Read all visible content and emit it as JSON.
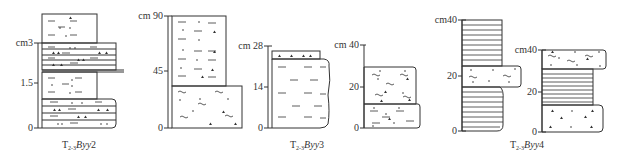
{
  "figure": {
    "type": "stratigraphic-columns",
    "line_color": "#333333",
    "background": "#ffffff"
  },
  "columns": [
    {
      "id": "by2",
      "caption": {
        "prefix": "T",
        "sub": "2-3",
        "name": "By",
        "num": "2"
      },
      "axis": {
        "unit": "cm",
        "ticks": [
          {
            "label": "cm3",
            "value": 3
          },
          {
            "label": "1.5",
            "value": 1.5
          },
          {
            "label": "0",
            "value": 0
          }
        ]
      },
      "layers_bottom_to_top": [
        "silty fine sandstone (thin laminated, wide)",
        "siltstone with dots/triangles",
        "thin interbedded laminae (wide)",
        "siltstone with dots/triangles"
      ]
    },
    {
      "id": "by3",
      "caption": {
        "prefix": "T",
        "sub": "2-3",
        "name": "By",
        "num": "3"
      },
      "sub_columns": [
        {
          "axis": {
            "ticks": [
              {
                "label": "cm 90",
                "value": 90
              },
              {
                "label": "45",
                "value": 45
              },
              {
                "label": "0",
                "value": 0
              }
            ]
          },
          "layers_bottom_to_top": [
            "wavy-laminated sandstone with dots",
            "siltstone with dashes and dots"
          ]
        },
        {
          "axis": {
            "ticks": [
              {
                "label": "cm 28",
                "value": 28
              },
              {
                "label": "14",
                "value": 14
              },
              {
                "label": "0",
                "value": 0
              }
            ]
          },
          "layers_bottom_to_top": [
            "mudstone with dashes (irregular boundary)",
            "thin sandstone with triangles"
          ]
        },
        {
          "axis": {
            "ticks": [
              {
                "label": "cm 40",
                "value": 40
              },
              {
                "label": "20",
                "value": 20
              },
              {
                "label": "0",
                "value": 0
              }
            ]
          },
          "layers_bottom_to_top": [
            "silty sandstone with dashes and dots",
            "wavy-laminated sandstone"
          ]
        }
      ]
    },
    {
      "id": "by4",
      "caption": {
        "prefix": "T",
        "sub": "2-3",
        "name": "By",
        "num": "4"
      },
      "sub_columns": [
        {
          "axis": {
            "ticks": [
              {
                "label": "cm40",
                "value": 40
              },
              {
                "label": "20",
                "value": 20
              },
              {
                "label": "0",
                "value": 0
              }
            ]
          },
          "layers_bottom_to_top": [
            "horizontally laminated mudstone",
            "wavy-laminated sandstone lens",
            "horizontally laminated mudstone"
          ]
        },
        {
          "axis": {
            "ticks": [
              {
                "label": "cm40",
                "value": 40
              },
              {
                "label": "20",
                "value": 20
              },
              {
                "label": "0",
                "value": 0
              }
            ]
          },
          "layers_bottom_to_top": [
            "sandstone with triangles",
            "horizontally laminated mudstone",
            "wavy-laminated sandstone"
          ]
        }
      ]
    }
  ],
  "labels": {
    "c1_t3": "cm3",
    "c1_t15": "1.5",
    "c1_t0": "0",
    "c2_t90": "cm 90",
    "c2_t45": "45",
    "c2_t0": "0",
    "c3_t28": "cm 28",
    "c3_t14": "14",
    "c3_t0": "0",
    "c4_t40": "cm 40",
    "c4_t20": "20",
    "c4_t0": "0",
    "c5_t40": "cm40",
    "c5_t20": "20",
    "c5_t0": "0",
    "c6_t40": "cm40",
    "c6_t20": "20",
    "c6_t0": "0",
    "cap_prefix": "T",
    "cap_sub": "2-3",
    "cap_name": "By",
    "cap2_num": "2",
    "cap3_num": "3",
    "cap4_num": "4"
  }
}
